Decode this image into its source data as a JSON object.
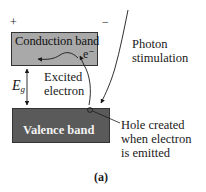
{
  "diagram": {
    "polarity": {
      "positive": "+",
      "negative": "−"
    },
    "conduction_band": {
      "label": "Conduction band",
      "color": "#a9a9a9"
    },
    "valence_band": {
      "label": "Valence band",
      "color": "#5a5a5a"
    },
    "electron_symbol": "e⁻",
    "band_gap": {
      "symbol": "E",
      "subscript": "g"
    },
    "excited_electron": {
      "line1": "Excited",
      "line2": "electron"
    },
    "photon": {
      "line1": "Photon",
      "line2": "stimulation"
    },
    "hole": {
      "line1": "Hole  created",
      "line2": "when electron",
      "line3": "is emitted"
    },
    "caption": "(a)"
  }
}
